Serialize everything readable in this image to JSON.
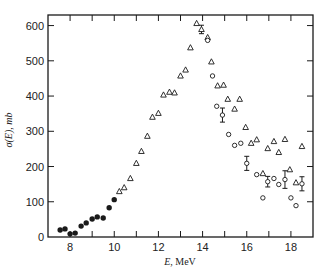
{
  "chart_data": {
    "type": "scatter",
    "title": "",
    "xlabel": "E, MeV",
    "ylabel": "σ(E), mb",
    "xlim": [
      7,
      19
    ],
    "ylim": [
      0,
      630
    ],
    "x_ticks": [
      8,
      10,
      12,
      14,
      16,
      18
    ],
    "x_minor_ticks": [
      7,
      9,
      11,
      13,
      15,
      17,
      19
    ],
    "y_ticks": [
      0,
      100,
      200,
      300,
      400,
      500,
      600
    ],
    "grid": false,
    "legend": null,
    "series": [
      {
        "name": "filled circles",
        "marker": "filled-circle",
        "points": [
          {
            "x": 7.55,
            "y": 20
          },
          {
            "x": 7.77,
            "y": 23
          },
          {
            "x": 8.0,
            "y": 9
          },
          {
            "x": 8.23,
            "y": 11
          },
          {
            "x": 8.5,
            "y": 31
          },
          {
            "x": 8.73,
            "y": 40
          },
          {
            "x": 9.0,
            "y": 51
          },
          {
            "x": 9.23,
            "y": 57
          },
          {
            "x": 9.5,
            "y": 54
          },
          {
            "x": 9.77,
            "y": 83
          },
          {
            "x": 10.0,
            "y": 106
          }
        ]
      },
      {
        "name": "open triangles",
        "marker": "open-triangle",
        "points": [
          {
            "x": 10.23,
            "y": 129
          },
          {
            "x": 10.45,
            "y": 140
          },
          {
            "x": 10.73,
            "y": 166
          },
          {
            "x": 11.0,
            "y": 209
          },
          {
            "x": 11.23,
            "y": 243
          },
          {
            "x": 11.5,
            "y": 286
          },
          {
            "x": 11.73,
            "y": 340
          },
          {
            "x": 12.0,
            "y": 351
          },
          {
            "x": 12.23,
            "y": 403
          },
          {
            "x": 12.5,
            "y": 411
          },
          {
            "x": 12.73,
            "y": 409
          },
          {
            "x": 13.0,
            "y": 457
          },
          {
            "x": 13.23,
            "y": 474
          },
          {
            "x": 13.45,
            "y": 537
          },
          {
            "x": 13.73,
            "y": 606
          },
          {
            "x": 13.95,
            "y": 589,
            "err": 12
          },
          {
            "x": 14.23,
            "y": 566
          },
          {
            "x": 14.4,
            "y": 497
          },
          {
            "x": 14.68,
            "y": 429
          },
          {
            "x": 14.95,
            "y": 431
          },
          {
            "x": 15.14,
            "y": 391
          },
          {
            "x": 15.45,
            "y": 363
          },
          {
            "x": 15.68,
            "y": 391
          },
          {
            "x": 15.95,
            "y": 311
          },
          {
            "x": 16.2,
            "y": 266
          },
          {
            "x": 16.45,
            "y": 276
          },
          {
            "x": 16.73,
            "y": 180
          },
          {
            "x": 16.95,
            "y": 251
          },
          {
            "x": 17.23,
            "y": 271
          },
          {
            "x": 17.45,
            "y": 240
          },
          {
            "x": 17.73,
            "y": 277
          },
          {
            "x": 17.95,
            "y": 191
          },
          {
            "x": 18.23,
            "y": 154
          },
          {
            "x": 18.5,
            "y": 257
          }
        ]
      },
      {
        "name": "open circles",
        "marker": "open-circle",
        "points": [
          {
            "x": 14.23,
            "y": 558
          },
          {
            "x": 14.45,
            "y": 457
          },
          {
            "x": 14.64,
            "y": 371
          },
          {
            "x": 14.9,
            "y": 346,
            "err": 20
          },
          {
            "x": 15.18,
            "y": 291
          },
          {
            "x": 15.45,
            "y": 260
          },
          {
            "x": 15.73,
            "y": 266
          },
          {
            "x": 16.0,
            "y": 209,
            "err": 20
          },
          {
            "x": 16.45,
            "y": 177
          },
          {
            "x": 16.73,
            "y": 111
          },
          {
            "x": 16.95,
            "y": 157,
            "err": 15
          },
          {
            "x": 17.23,
            "y": 166
          },
          {
            "x": 17.45,
            "y": 149
          },
          {
            "x": 17.73,
            "y": 163,
            "err": 25
          },
          {
            "x": 18.0,
            "y": 111
          },
          {
            "x": 18.23,
            "y": 89
          },
          {
            "x": 18.5,
            "y": 151,
            "err": 20
          }
        ]
      }
    ]
  },
  "labels": {
    "xlabel_var": "E,",
    "xlabel_unit": " MeV",
    "ylabel_var": "σ(E),",
    "ylabel_unit": " mb"
  },
  "style": {
    "ink": "#1a1a1a",
    "background": "#ffffff"
  }
}
